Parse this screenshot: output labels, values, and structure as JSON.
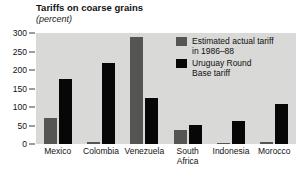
{
  "chart_data": {
    "type": "bar",
    "title": "Tariffs on coarse grains",
    "subtitle": "(percent)",
    "xlabel": "",
    "ylabel": "",
    "ylim": [
      0,
      300
    ],
    "yticks": [
      300,
      250,
      200,
      150,
      100,
      50,
      0
    ],
    "grid": false,
    "legend_position": "upper-right-inside",
    "categories": [
      "Mexico",
      "Colombia",
      "Venezuela",
      "South Africa",
      "Indonesia",
      "Morocco"
    ],
    "category_lines": [
      [
        "Mexico"
      ],
      [
        "Colombia"
      ],
      [
        "Venezuela"
      ],
      [
        "South",
        "Africa"
      ],
      [
        "Indonesia"
      ],
      [
        "Morocco"
      ]
    ],
    "series": [
      {
        "name": "Estimated actual tariff in 1986-88",
        "name_lines": [
          "Estimated actual tariff",
          "in 1986–88"
        ],
        "color": "#555553",
        "values": [
          70,
          5,
          290,
          38,
          3,
          5
        ]
      },
      {
        "name": "Uruguay Round Base tariff",
        "name_lines": [
          "Uruguay Round",
          "Base tariff"
        ],
        "color": "#070707",
        "values": [
          175,
          220,
          125,
          52,
          62,
          108
        ]
      }
    ]
  },
  "colors": {
    "plot_background": "#d9d9d7",
    "page_background": "#ffffff",
    "text": "#121212",
    "series_gray": "#555553",
    "series_black": "#070707"
  }
}
